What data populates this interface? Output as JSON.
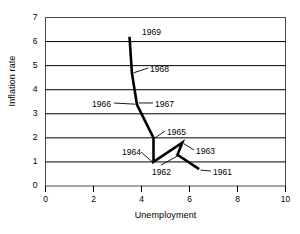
{
  "chart_data": {
    "type": "line",
    "title": "",
    "xlabel": "Unemployment",
    "ylabel": "Inflation rate",
    "xlim": [
      0,
      10
    ],
    "ylim": [
      0,
      7
    ],
    "xticks": [
      "0",
      "2",
      "4",
      "6",
      "8",
      "10"
    ],
    "yticks": [
      "0",
      "1",
      "2",
      "3",
      "4",
      "5",
      "6",
      "7"
    ],
    "grid": "horizontal",
    "legend": "none",
    "line_color": "#000000",
    "series": [
      {
        "name": "Phillips curve path",
        "points": [
          {
            "label": "1961",
            "x": 6.4,
            "y": 0.7
          },
          {
            "label": "1962",
            "x": 5.5,
            "y": 1.3
          },
          {
            "label": "1963",
            "x": 5.7,
            "y": 1.8
          },
          {
            "label": "1964",
            "x": 4.5,
            "y": 1.0
          },
          {
            "label": "1965",
            "x": 4.5,
            "y": 2.0
          },
          {
            "label": "1966",
            "x": 3.8,
            "y": 3.4
          },
          {
            "label": "1967",
            "x": 3.8,
            "y": 3.45
          },
          {
            "label": "1968",
            "x": 3.6,
            "y": 4.7
          },
          {
            "label": "1969",
            "x": 3.5,
            "y": 6.2
          }
        ]
      }
    ],
    "annotations": [
      {
        "text": "1969",
        "x": 142,
        "y": 27
      },
      {
        "text": "1968",
        "x": 150,
        "y": 64
      },
      {
        "text": "1967",
        "x": 155,
        "y": 99
      },
      {
        "text": "1966",
        "x": 92,
        "y": 99
      },
      {
        "text": "1965",
        "x": 167,
        "y": 127
      },
      {
        "text": "1964",
        "x": 122,
        "y": 147
      },
      {
        "text": "1963",
        "x": 196,
        "y": 146
      },
      {
        "text": "1962",
        "x": 152,
        "y": 167
      },
      {
        "text": "1961",
        "x": 213,
        "y": 167
      }
    ]
  },
  "axes": {
    "x_title": "Unemployment",
    "y_title": "Inflation rate"
  }
}
